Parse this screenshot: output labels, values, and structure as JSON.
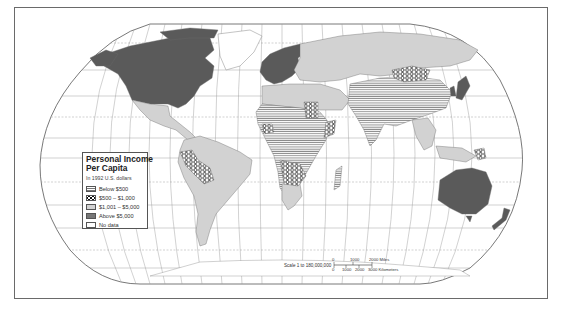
{
  "map": {
    "title": "Personal Income Per Capita",
    "projection": "Robinson",
    "legend": {
      "title_line1": "Personal Income",
      "title_line2": "Per Capita",
      "subtitle": "In 1992 U.S. dollars",
      "items": [
        {
          "label": "Below $500",
          "pattern": "horizontal-lines",
          "color": "#777777"
        },
        {
          "label": "$500 – $1,000",
          "pattern": "hexagon-dots",
          "color": "#111111"
        },
        {
          "label": "$1,001 – $5,000",
          "pattern": "light-gray",
          "color": "#d2d2d2"
        },
        {
          "label": "Above $5,000",
          "pattern": "dark-gray",
          "color": "#777777"
        },
        {
          "label": "No data",
          "pattern": "white",
          "color": "#ffffff"
        }
      ]
    },
    "scale": {
      "text": "Scale  1 to 180,000,000",
      "miles_labels": [
        "0",
        "1000",
        "2000 Miles"
      ],
      "km_labels": [
        "0",
        "1000",
        "2000",
        "3000 Kilometers"
      ]
    },
    "colors": {
      "frame": "#6a6a6a",
      "graticule": "#8a8a8a",
      "above": "#5a5a5a",
      "upper_middle": "#d2d2d2",
      "below_lines": "#777777",
      "ocean": "#ffffff"
    }
  }
}
